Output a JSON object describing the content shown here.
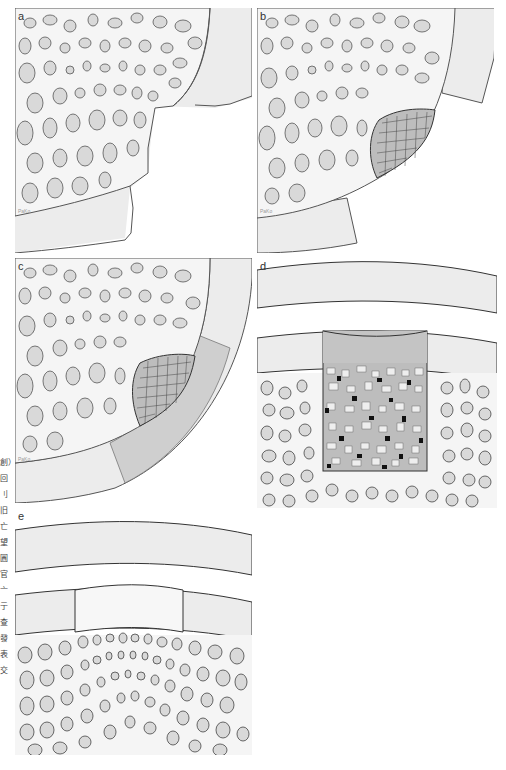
{
  "figure": {
    "panels": [
      {
        "id": "a",
        "label": "a",
        "signature": "PaKo",
        "description": "trabecular bone with cartilage layer and irregular defect cut-out"
      },
      {
        "id": "b",
        "label": "b",
        "signature": "PaKo",
        "description": "defect filled with cancellous bone chips at bone edge"
      },
      {
        "id": "c",
        "label": "c",
        "signature": "PaKo",
        "description": "bone chips covered with membrane / graft layer"
      },
      {
        "id": "d",
        "label": "d",
        "description": "rectangular defect filled with mixed graft particles beneath covering layer"
      },
      {
        "id": "e",
        "label": "e",
        "description": "healed defect with regenerated layer and dense trabecular bone"
      }
    ],
    "margin_text": "創）回 刂 旧 亡 望 圓 官 亠 亍 查 發 表 交"
  },
  "colors": {
    "background": "#ffffff",
    "cartilage": "#ececec",
    "bone_matrix": "#f4f4f4",
    "trabecula_fill": "#d9d9d9",
    "outline": "#555555",
    "membrane": "#cfcfcf",
    "graft_dark": "#111111"
  }
}
